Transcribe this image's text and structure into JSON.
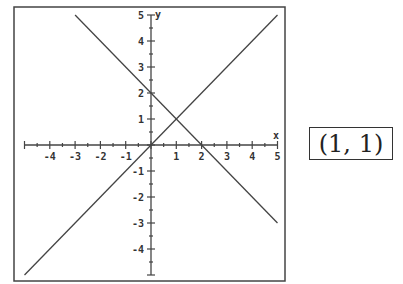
{
  "chart_data": {
    "type": "line",
    "title": "",
    "xlabel": "x",
    "ylabel": "y",
    "xlim": [
      -5,
      5
    ],
    "ylim": [
      -5,
      5
    ],
    "grid": false,
    "x_ticks": [
      -4,
      -3,
      -2,
      -1,
      1,
      2,
      3,
      4,
      5
    ],
    "y_ticks": [
      -4,
      -3,
      -2,
      -1,
      1,
      2,
      3,
      4,
      5
    ],
    "x_tick_labels": [
      "-4",
      "-3",
      "-2",
      "-1",
      "1",
      "2",
      "3",
      "4",
      "5"
    ],
    "y_tick_labels": [
      "-4",
      "-3",
      "-2",
      "-1",
      "1",
      "2",
      "3",
      "4",
      "5"
    ],
    "series": [
      {
        "name": "y = x",
        "x": [
          -5,
          5
        ],
        "y": [
          -5,
          5
        ]
      },
      {
        "name": "y = -x + 2",
        "x": [
          -3,
          5
        ],
        "y": [
          5,
          -3
        ]
      }
    ],
    "annotations": [
      {
        "text": "(1, 1)",
        "type": "intersection"
      }
    ],
    "legend": "none"
  },
  "answer": {
    "text": "(1, 1)"
  },
  "colors": {
    "line": "#444444",
    "axis": "#444444",
    "frame": "#444444"
  }
}
